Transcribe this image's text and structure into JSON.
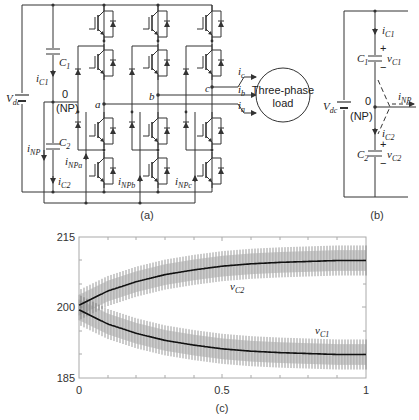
{
  "figure": {
    "panel_a": {
      "caption": "(a)",
      "labels": {
        "vdc": "V",
        "vdc_sub": "dc",
        "c1": "C",
        "c1_sub": "1",
        "c2": "C",
        "c2_sub": "2",
        "ic1": "i",
        "ic1_sub": "C1",
        "ic2": "i",
        "ic2_sub": "C2",
        "inp": "i",
        "inp_sub": "NP",
        "np_zero": "0",
        "np": "(NP)",
        "node_a": "a",
        "node_b": "b",
        "node_c": "c",
        "inpa": "i",
        "inpa_sub": "NPa",
        "inpb": "i",
        "inpb_sub": "NPb",
        "inpc": "i",
        "inpc_sub": "NPc",
        "ia": "i",
        "ia_sub": "a",
        "ib": "i",
        "ib_sub": "b",
        "ic": "i",
        "ic_sub": "c",
        "load_line1": "Three-phase",
        "load_line2": "load"
      }
    },
    "panel_b": {
      "caption": "(b)",
      "labels": {
        "vdc": "V",
        "vdc_sub": "dc",
        "c1": "C",
        "c1_sub": "1",
        "c2": "C",
        "c2_sub": "2",
        "ic1": "i",
        "ic1_sub": "C1",
        "ic2": "i",
        "ic2_sub": "C2",
        "vc1": "v",
        "vc1_sub": "C1",
        "vc2": "v",
        "vc2_sub": "C2",
        "inp": "i",
        "inp_sub": "NP",
        "np_zero": "0",
        "np": "(NP)",
        "plus": "+",
        "minus": "−"
      }
    },
    "panel_c": {
      "caption": "(c)",
      "y_ticks": [
        "215",
        "200",
        "185"
      ],
      "x_ticks": [
        "0",
        "0.5",
        "1"
      ],
      "series_labels": {
        "vc2": "v",
        "vc2_sub": "C2",
        "vc1": "v",
        "vc1_sub": "C1"
      }
    }
  },
  "chart_data": {
    "type": "line",
    "title": "",
    "xlabel": "",
    "ylabel": "",
    "xlim": [
      0,
      1
    ],
    "ylim": [
      185,
      215
    ],
    "x_ticks": [
      0,
      0.5,
      1
    ],
    "y_ticks": [
      185,
      200,
      215
    ],
    "grid": false,
    "series": [
      {
        "name": "vC2",
        "description": "Upper capacitor voltage with high-frequency ripple (~±3 V band), rising exponentially from 200 toward ~210",
        "x": [
          0,
          0.1,
          0.2,
          0.3,
          0.4,
          0.5,
          0.6,
          0.7,
          0.8,
          0.9,
          1.0
        ],
        "values": [
          200.5,
          203.5,
          205.5,
          207,
          208,
          208.8,
          209.3,
          209.6,
          209.8,
          210,
          210
        ]
      },
      {
        "name": "vC1",
        "description": "Lower capacitor voltage with high-frequency ripple (~±3 V band), falling exponentially from 200 toward ~190",
        "x": [
          0,
          0.1,
          0.2,
          0.3,
          0.4,
          0.5,
          0.6,
          0.7,
          0.8,
          0.9,
          1.0
        ],
        "values": [
          199.5,
          196.5,
          194.5,
          193,
          192,
          191.2,
          190.7,
          190.4,
          190.2,
          190,
          190
        ]
      }
    ]
  }
}
